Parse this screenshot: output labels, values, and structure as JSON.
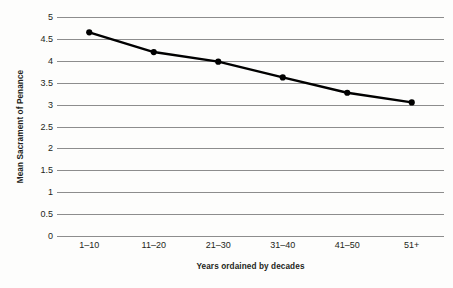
{
  "chart_data": {
    "type": "line",
    "title": "",
    "subtitle": "",
    "xlabel": "Years ordained by decades",
    "ylabel": "Mean Sacrament of Penance",
    "categories": [
      "1–10",
      "11–20",
      "21–30",
      "31–40",
      "41–50",
      "51+"
    ],
    "values": [
      4.65,
      4.2,
      3.98,
      3.62,
      3.27,
      3.05
    ],
    "series": [
      {
        "name": "Mean Sacrament of Penance",
        "values": [
          4.65,
          4.2,
          3.98,
          3.62,
          3.27,
          3.05
        ]
      }
    ],
    "ylim": [
      0,
      5
    ],
    "yticks": [
      5,
      4.5,
      4,
      3.5,
      3,
      2.5,
      2,
      1.5,
      1,
      0.5,
      0
    ],
    "ytick_labels": [
      "5",
      "4.5",
      "4",
      "3.5",
      "3",
      "2.5",
      "2",
      "1.5",
      "1",
      "0.5",
      "0"
    ],
    "grid": "horizontal",
    "legend": "none",
    "marker": "circle",
    "colors": {
      "line": "#000000",
      "marker": "#000000",
      "gridline": "#8d8d8d",
      "text": "#231f20",
      "background": "#fdfdfc"
    }
  }
}
